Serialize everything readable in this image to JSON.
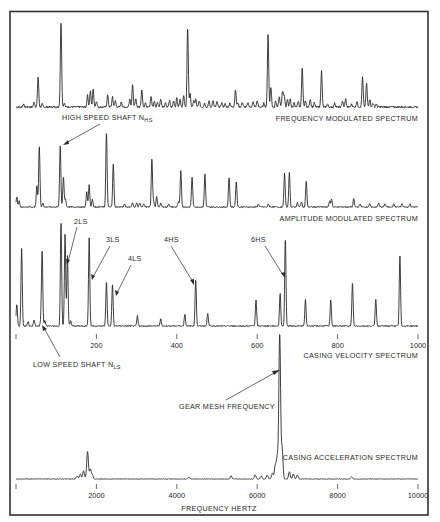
{
  "colors": {
    "ink": "#2a2a2a",
    "frame": "#333333",
    "background": "#ffffff"
  },
  "frame": {
    "x1": 10,
    "y1": 11,
    "x2": 428,
    "y2": 515
  },
  "chart_data": [
    {
      "type": "line",
      "title": "FREQUENCY MODULATED SPECTRUM",
      "xlabel": "",
      "ylabel": "",
      "grid": false,
      "xlim": [
        0,
        1000
      ],
      "px": {
        "x0": 16,
        "x1": 418,
        "baseline": 107,
        "top": 23
      },
      "annotations": [
        {
          "text": "HIGH SPEED SHAFT",
          "sub": "HS",
          "prefix": "N",
          "target_x": 118
        }
      ],
      "peaks": [
        [
          18,
          3
        ],
        [
          45,
          5
        ],
        [
          55,
          30
        ],
        [
          65,
          3
        ],
        [
          110,
          3
        ],
        [
          112,
          85
        ],
        [
          120,
          4
        ],
        [
          178,
          12
        ],
        [
          185,
          16
        ],
        [
          192,
          18
        ],
        [
          200,
          6
        ],
        [
          228,
          12
        ],
        [
          240,
          10
        ],
        [
          247,
          6
        ],
        [
          262,
          5
        ],
        [
          283,
          8
        ],
        [
          290,
          22
        ],
        [
          298,
          8
        ],
        [
          313,
          18
        ],
        [
          322,
          5
        ],
        [
          336,
          10
        ],
        [
          344,
          6
        ],
        [
          352,
          5
        ],
        [
          360,
          8
        ],
        [
          372,
          4
        ],
        [
          382,
          7
        ],
        [
          392,
          6
        ],
        [
          400,
          9
        ],
        [
          408,
          8
        ],
        [
          417,
          11
        ],
        [
          427,
          80
        ],
        [
          433,
          14
        ],
        [
          442,
          6
        ],
        [
          447,
          8
        ],
        [
          456,
          6
        ],
        [
          469,
          4
        ],
        [
          480,
          6
        ],
        [
          490,
          7
        ],
        [
          500,
          5
        ],
        [
          512,
          4
        ],
        [
          520,
          3
        ],
        [
          532,
          4
        ],
        [
          546,
          18
        ],
        [
          552,
          4
        ],
        [
          563,
          5
        ],
        [
          577,
          4
        ],
        [
          590,
          5
        ],
        [
          600,
          6
        ],
        [
          617,
          4
        ],
        [
          627,
          73
        ],
        [
          634,
          20
        ],
        [
          646,
          6
        ],
        [
          655,
          10
        ],
        [
          663,
          16
        ],
        [
          667,
          12
        ],
        [
          675,
          8
        ],
        [
          682,
          8
        ],
        [
          692,
          4
        ],
        [
          702,
          6
        ],
        [
          712,
          39
        ],
        [
          720,
          6
        ],
        [
          732,
          8
        ],
        [
          742,
          4
        ],
        [
          760,
          36
        ],
        [
          775,
          3
        ],
        [
          793,
          4
        ],
        [
          812,
          6
        ],
        [
          820,
          8
        ],
        [
          835,
          3
        ],
        [
          848,
          6
        ],
        [
          862,
          30
        ],
        [
          872,
          24
        ],
        [
          880,
          8
        ],
        [
          888,
          4
        ],
        [
          896,
          3
        ]
      ],
      "noise_amplitude": 3
    },
    {
      "type": "line",
      "title": "AMPLITUDE MODULATED SPECTRUM",
      "xlabel": "",
      "ylabel": "",
      "grid": false,
      "xlim": [
        0,
        1000
      ],
      "px": {
        "x0": 16,
        "x1": 418,
        "baseline": 207,
        "top": 131
      },
      "peaks": [
        [
          2,
          10
        ],
        [
          8,
          6
        ],
        [
          52,
          22
        ],
        [
          58,
          62
        ],
        [
          67,
          4
        ],
        [
          110,
          62
        ],
        [
          118,
          30
        ],
        [
          123,
          8
        ],
        [
          176,
          15
        ],
        [
          182,
          22
        ],
        [
          190,
          8
        ],
        [
          225,
          75
        ],
        [
          242,
          43
        ],
        [
          270,
          3
        ],
        [
          290,
          4
        ],
        [
          300,
          4
        ],
        [
          308,
          4
        ],
        [
          318,
          3
        ],
        [
          338,
          48
        ],
        [
          342,
          6
        ],
        [
          350,
          10
        ],
        [
          360,
          4
        ],
        [
          380,
          3
        ],
        [
          404,
          5
        ],
        [
          410,
          37
        ],
        [
          438,
          30
        ],
        [
          470,
          33
        ],
        [
          530,
          30
        ],
        [
          548,
          26
        ],
        [
          603,
          3
        ],
        [
          628,
          3
        ],
        [
          668,
          34
        ],
        [
          680,
          34
        ],
        [
          700,
          4
        ],
        [
          710,
          5
        ],
        [
          722,
          26
        ],
        [
          780,
          6
        ],
        [
          785,
          8
        ],
        [
          840,
          8
        ],
        [
          856,
          3
        ],
        [
          880,
          3
        ],
        [
          902,
          4
        ],
        [
          918,
          3
        ],
        [
          940,
          3
        ],
        [
          960,
          3
        ],
        [
          980,
          3
        ]
      ],
      "noise_amplitude": 2
    },
    {
      "type": "line",
      "title": "CASING VELOCITY SPECTRUM",
      "xlabel": "",
      "ylabel": "",
      "grid": false,
      "xlim": [
        0,
        1000
      ],
      "xticks": [
        0,
        200,
        400,
        600,
        800,
        1000
      ],
      "xticklabels": [
        "",
        "200",
        "400",
        "600",
        "800",
        "1000"
      ],
      "px": {
        "x0": 16,
        "x1": 418,
        "baseline": 326,
        "top": 222,
        "tick_y": 334
      },
      "annotations": [
        {
          "text": "2LS",
          "target_x": 128
        },
        {
          "text": "3LS",
          "target_x": 186
        },
        {
          "text": "4LS",
          "target_x": 240
        },
        {
          "text": "4HS",
          "target_x": 447
        },
        {
          "text": "6HS",
          "target_x": 667
        },
        {
          "text": "LOW SPEED SHAFT",
          "prefix": "N",
          "sub": "LS",
          "target_x": 62
        }
      ],
      "peaks": [
        [
          2,
          22
        ],
        [
          14,
          78
        ],
        [
          30,
          4
        ],
        [
          45,
          6
        ],
        [
          62,
          5
        ],
        [
          65,
          75
        ],
        [
          72,
          6
        ],
        [
          112,
          105
        ],
        [
          122,
          92
        ],
        [
          128,
          70
        ],
        [
          136,
          5
        ],
        [
          182,
          88
        ],
        [
          225,
          45
        ],
        [
          240,
          42
        ],
        [
          302,
          10
        ],
        [
          360,
          7
        ],
        [
          420,
          12
        ],
        [
          447,
          47
        ],
        [
          477,
          13
        ],
        [
          597,
          26
        ],
        [
          657,
          33
        ],
        [
          670,
          88
        ],
        [
          720,
          26
        ],
        [
          783,
          26
        ],
        [
          837,
          43
        ],
        [
          895,
          27
        ],
        [
          955,
          70
        ]
      ],
      "noise_amplitude": 2
    },
    {
      "type": "line",
      "title": "CASING ACCELERATION SPECTRUM",
      "xlabel": "FREQUENCY HERTZ",
      "ylabel": "",
      "grid": false,
      "xlim": [
        0,
        10000
      ],
      "xticks": [
        0,
        2000,
        4000,
        6000,
        8000,
        10000
      ],
      "xticklabels": [
        "",
        "2000",
        "4000",
        "6000",
        "8000",
        "10000"
      ],
      "px": {
        "x0": 16,
        "x1": 418,
        "baseline": 479,
        "top": 333,
        "tick_y": 484
      },
      "annotations": [
        {
          "text": "GEAR MESH FREQUENCY",
          "target_x": 6580
        }
      ],
      "peaks": [
        [
          1520,
          3
        ],
        [
          1600,
          5
        ],
        [
          1680,
          8
        ],
        [
          1780,
          28
        ],
        [
          1850,
          10
        ],
        [
          1900,
          4
        ],
        [
          4300,
          2
        ],
        [
          5350,
          3
        ],
        [
          5950,
          4
        ],
        [
          6100,
          3
        ],
        [
          6250,
          4
        ],
        [
          6380,
          6
        ],
        [
          6450,
          14
        ],
        [
          6500,
          22
        ],
        [
          6560,
          146
        ],
        [
          6620,
          30
        ],
        [
          6800,
          7
        ],
        [
          6900,
          5
        ],
        [
          7000,
          4
        ],
        [
          8350,
          2
        ]
      ],
      "noise_amplitude": 1
    }
  ],
  "labels": {
    "fm_title": "FREQUENCY MODULATED SPECTRUM",
    "am_title": "AMPLITUDE MODULATED SPECTRUM",
    "vel_title": "CASING VELOCITY SPECTRUM",
    "acc_title": "CASING ACCELERATION SPECTRUM",
    "hs_shaft": "HIGH SPEED SHAFT  N",
    "hs_sub": "HS",
    "ls_shaft": "LOW SPEED SHAFT  N",
    "ls_sub": "LS",
    "lbl_2ls": "2LS",
    "lbl_3ls": "3LS",
    "lbl_4ls": "4LS",
    "lbl_4hs": "4HS",
    "lbl_6hs": "6HS",
    "gear_mesh": "GEAR MESH FREQUENCY",
    "x_axis_title": "FREQUENCY HERTZ",
    "vel_ticks": [
      "",
      "200",
      "400",
      "600",
      "800",
      "1000"
    ],
    "acc_ticks": [
      "",
      "2000",
      "4000",
      "6000",
      "8000",
      "10000"
    ]
  }
}
